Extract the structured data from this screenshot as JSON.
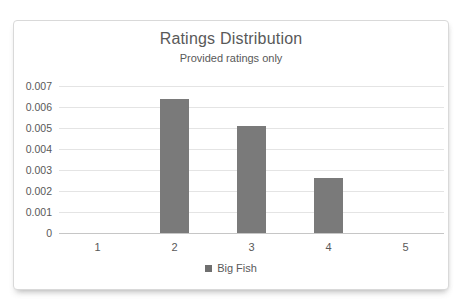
{
  "chart_data": {
    "type": "bar",
    "title": "Ratings Distribution",
    "subtitle": "Provided ratings only",
    "categories": [
      "1",
      "2",
      "3",
      "4",
      "5"
    ],
    "series": [
      {
        "name": "Big Fish",
        "values": [
          0,
          0.0064,
          0.0051,
          0.0026,
          0
        ]
      }
    ],
    "xlabel": "",
    "ylabel": "",
    "ylim": [
      0,
      0.007
    ],
    "yticks": [
      "0",
      "0.001",
      "0.002",
      "0.003",
      "0.004",
      "0.005",
      "0.006",
      "0.007"
    ],
    "grid": true,
    "legend_position": "bottom",
    "colors": {
      "bar": "#7a7a7a",
      "text": "#595959",
      "gridline": "#e4e4e4",
      "axis_line": "#c6c6c6",
      "frame_border": "#d9d9d9",
      "background": "#ffffff"
    }
  }
}
